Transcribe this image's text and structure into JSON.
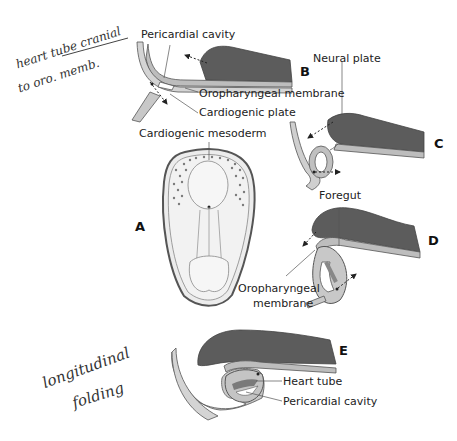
{
  "colors": {
    "neural": "#5c5c5c",
    "ectoderm": "#b9b9b9",
    "endoderm": "#d6d6d6",
    "outline": "#555555",
    "mesoderm_dots": "#7a7a7a",
    "embryo_fill": "#ececec",
    "text": "#222222",
    "handwriting": "#333333"
  },
  "handwriting": {
    "top_note_line1": "heart tube cranial",
    "top_note_line2": "to oro. memb.",
    "bottom_note_line1": "longitudinal",
    "bottom_note_line2": "folding"
  },
  "panels": {
    "A": {
      "letter": "A",
      "labels": {
        "cardiogenic_mesoderm": "Cardiogenic mesoderm"
      }
    },
    "B": {
      "letter": "B",
      "labels": {
        "pericardial_cavity": "Pericardial cavity",
        "oropharyngeal_membrane": "Oropharyngeal membrane",
        "cardiogenic_plate": "Cardiogenic plate"
      }
    },
    "C": {
      "letter": "C",
      "labels": {
        "neural_plate": "Neural plate"
      }
    },
    "D": {
      "letter": "D",
      "labels": {
        "foregut": "Foregut",
        "oropharyngeal_membrane_line1": "Oropharyngeal",
        "oropharyngeal_membrane_line2": "membrane"
      }
    },
    "E": {
      "letter": "E",
      "labels": {
        "heart_tube": "Heart tube",
        "pericardial_cavity": "Pericardial cavity"
      }
    }
  }
}
